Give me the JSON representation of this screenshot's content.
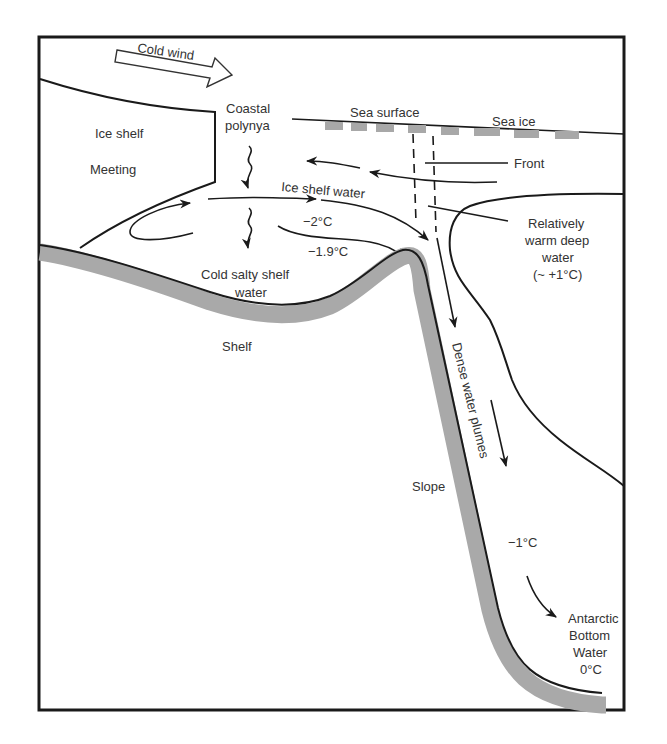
{
  "figure": {
    "type": "diagram",
    "colors": {
      "frame": "#1a1a1a",
      "lines": "#1a1a1a",
      "seabed": "#a9a9a9",
      "sea_ice": "#a8a8a8",
      "text": "#333333",
      "background": "#ffffff"
    }
  },
  "labels": {
    "cold_wind": "Cold wind",
    "ice_shelf": "Ice shelf",
    "meeting": "Meeting",
    "coastal_polynya_line1": "Coastal",
    "coastal_polynya_line2": "polynya",
    "sea_surface": "Sea surface",
    "sea_ice": "Sea ice",
    "front": "Front",
    "ice_shelf_water": "Ice shelf water",
    "temp_minus2": "−2°C",
    "temp_minus1_9": "−1.9°C",
    "warm_deep_line1": "Relatively",
    "warm_deep_line2": "warm deep",
    "warm_deep_line3": "water",
    "warm_deep_line4": "(~ +1°C)",
    "cold_salty_line1": "Cold salty shelf",
    "cold_salty_line2": "water",
    "shelf": "Shelf",
    "slope": "Slope",
    "dense_plumes": "Dense water plumes",
    "temp_minus1": "−1°C",
    "aabw_line1": "Antarctic",
    "aabw_line2": "Bottom",
    "aabw_line3": "Water",
    "aabw_line4": "0°C"
  }
}
